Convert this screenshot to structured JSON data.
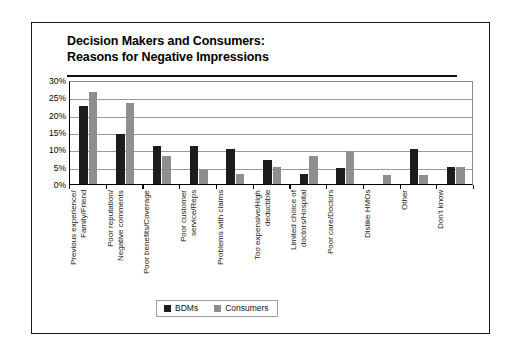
{
  "figure": {
    "title_line_1": "Decision Makers and Consumers:",
    "title_line_2": "Reasons for Negative Impressions"
  },
  "legend": {
    "entries": [
      {
        "label": "BDMs",
        "color": "#1c1c1c"
      },
      {
        "label": "Consumers",
        "color": "#8e8e8e"
      }
    ]
  },
  "axis": {
    "y_ticks": [
      "30%",
      "25%",
      "20%",
      "15%",
      "10%",
      "5%",
      "0%"
    ]
  },
  "chart_data": {
    "type": "bar",
    "title": "Decision Makers and Consumers: Reasons for Negative Impressions",
    "xlabel": "",
    "ylabel": "",
    "ylim": [
      0,
      30
    ],
    "ytick_values": [
      30,
      25,
      20,
      15,
      10,
      5,
      0
    ],
    "ytick_labels": [
      "30%",
      "25%",
      "20%",
      "15%",
      "10%",
      "5%",
      "0%"
    ],
    "grid": true,
    "grid_axis": "y",
    "legend_position": "bottom-center",
    "orientation": "vertical",
    "grouped": true,
    "categories": [
      "Previous experience/\nFamily/Friend",
      "Poor reputation/\nNegative comments",
      "Poor benefits/Coverage",
      "Poor customer\nservice/Reps",
      "Problems with claims",
      "Too expensive/High\ndeductible",
      "Limited choice of\ndoctors/Hospital",
      "Poor care/Doctors",
      "Dislike HMOs",
      "Other",
      "Don't know"
    ],
    "series": [
      {
        "name": "BDMs",
        "color": "#1c1c1c",
        "values": [
          22.5,
          14.5,
          11,
          11,
          10,
          7,
          3,
          4.5,
          0,
          10,
          5
        ]
      },
      {
        "name": "Consumers",
        "color": "#8e8e8e",
        "values": [
          26.5,
          23.5,
          8,
          4,
          3,
          5,
          8,
          9.5,
          2.5,
          2.5,
          5
        ]
      }
    ]
  }
}
